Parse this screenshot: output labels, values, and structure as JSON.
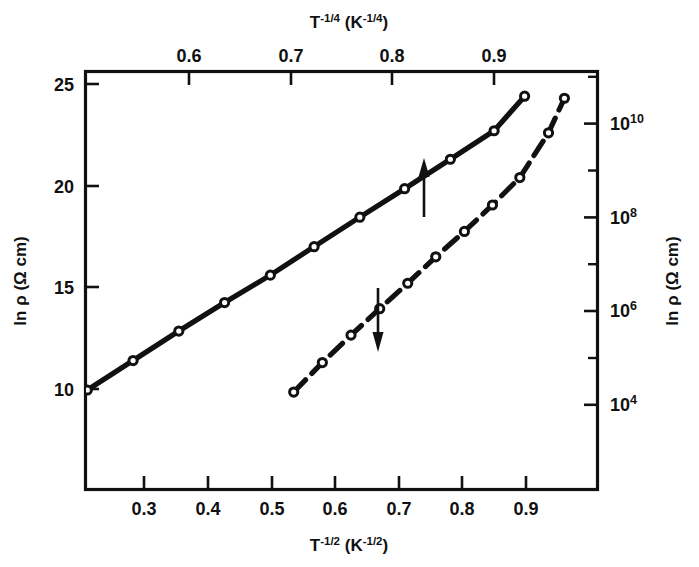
{
  "figure": {
    "kind": "scientific-plot",
    "background_color": "#ffffff",
    "ink_color": "#111111"
  },
  "axes": {
    "top": {
      "label_base": "T",
      "label_exp": "-1/4",
      "label_unit_base": "K",
      "label_unit_exp": "-1/4",
      "label_text": "T⁻¹ᐟ⁴ (K⁻¹ᐟ⁴)",
      "ticks": [
        "0.6",
        "0.7",
        "0.8",
        "0.9"
      ],
      "tick_values": [
        0.6,
        0.7,
        0.8,
        0.9
      ],
      "range": [
        0.487,
        0.952
      ]
    },
    "bottom": {
      "label_base": "T",
      "label_exp": "-1/2",
      "label_unit_base": "K",
      "label_unit_exp": "-1/2",
      "label_text": "T⁻¹ᐟ² (K⁻¹ᐟ²)",
      "ticks": [
        "0.3",
        "0.4",
        "0.5",
        "0.6",
        "0.7",
        "0.8",
        "0.9"
      ],
      "tick_values": [
        0.3,
        0.4,
        0.5,
        0.6,
        0.7,
        0.8,
        0.9
      ],
      "range": [
        0.208,
        1.012
      ]
    },
    "left": {
      "label_text": "ln ρ (Ω cm)",
      "ticks": [
        "10",
        "15",
        "20",
        "25"
      ],
      "tick_values": [
        10,
        15,
        20,
        25
      ],
      "range": [
        9.0,
        25.55
      ]
    },
    "right": {
      "label_text": "ln ρ (Ω cm)",
      "ticks": [
        "10",
        "10",
        "10",
        "10"
      ],
      "tick_exponents": [
        "4",
        "6",
        "8",
        "10"
      ],
      "tick_labels": [
        "10⁴",
        "10⁶",
        "10⁸",
        "10¹⁰"
      ],
      "tick_ln_values": [
        9.21,
        13.82,
        18.42,
        23.03
      ],
      "minor_tick_ln_values": [
        11.51,
        16.12,
        20.72,
        25.33
      ]
    }
  },
  "chart_data": {
    "type": "line",
    "title": "",
    "xlabel": "T^-1/2 (K^-1/2)",
    "ylabel": "ln rho (Ohm cm)",
    "xlim": [
      0.208,
      1.012
    ],
    "ylim": [
      9.0,
      25.55
    ],
    "grid": false,
    "legend": "none",
    "series": [
      {
        "name": "solid-line-top-axis",
        "style": "solid",
        "marker": "open-circle",
        "x_axis": "top",
        "annotation": "up-arrow",
        "x": [
          0.5,
          0.545,
          0.59,
          0.635,
          0.68,
          0.723,
          0.768,
          0.812,
          0.857,
          0.9,
          0.93
        ],
        "y": [
          9.95,
          11.4,
          12.85,
          14.25,
          15.6,
          17.0,
          18.45,
          19.85,
          21.3,
          22.7,
          24.4
        ]
      },
      {
        "name": "dashed-line-bottom-axis",
        "style": "dashed",
        "marker": "open-circle",
        "x_axis": "bottom",
        "annotation": "down-arrow",
        "x": [
          0.535,
          0.58,
          0.625,
          0.67,
          0.714,
          0.758,
          0.803,
          0.847,
          0.89,
          0.935,
          0.96
        ],
        "y": [
          9.85,
          11.3,
          12.65,
          13.95,
          15.2,
          16.5,
          17.75,
          19.05,
          20.4,
          22.6,
          24.3
        ]
      }
    ],
    "annotations": [
      {
        "name": "up-arrow",
        "direction": "up",
        "meaning": "solid curve reads top axis"
      },
      {
        "name": "down-arrow",
        "direction": "down",
        "meaning": "dashed curve reads bottom axis"
      }
    ]
  }
}
